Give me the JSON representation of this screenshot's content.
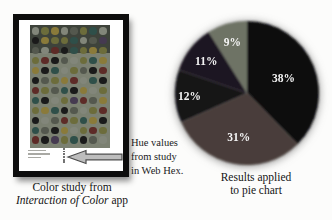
{
  "figure": {
    "background": "#fcfcfb",
    "left_caption": {
      "line1": "Color study from",
      "line2_italic": "Interaction of Color",
      "line2_regular": " app"
    },
    "right_caption": {
      "line1": "Results applied",
      "line2": "to pie chart"
    },
    "annotation": {
      "line1": "Hue values",
      "line2": "from study",
      "line3": "in Web Hex."
    }
  },
  "chart_data": {
    "type": "pie",
    "labels": [
      "38%",
      "31%",
      "12%",
      "11%",
      "9%"
    ],
    "values": [
      38,
      31,
      12,
      11,
      9
    ],
    "colors": [
      "#0b0b0e",
      "#4a3e3a",
      "#131218",
      "#1d1520",
      "#6e7365"
    ],
    "start_angle": "top",
    "direction": "clockwise",
    "label_color": "#f4f4f4",
    "label_radius": [
      0.55,
      0.62,
      0.8,
      0.72,
      0.74
    ],
    "caption": "Results applied to pie chart",
    "legend": "none",
    "source_note": "Hue values from study in Web Hex."
  },
  "artwork": {
    "frame_color": "#0d0d0d",
    "mat_color": "#ffffff",
    "bg_top": "#3e433b",
    "bg_bottom": "#7b8071",
    "palette": [
      "#1a1a1a",
      "#6c6c3b",
      "#82867a",
      "#5d2b27",
      "#2f4f49",
      "#54584e",
      "#8a7a3a",
      "#453a50"
    ],
    "rows": [
      "21625142",
      "06114257",
      "52304161",
      "13052146",
      "60421503",
      "05163240",
      "31540621",
      "40217356",
      "16405213",
      "02531460",
      "45062131",
      "30714052"
    ],
    "hex_strip_dots": 6
  },
  "arrow": {
    "fill": "#bdbdbd",
    "stroke": "#4c4c4c"
  }
}
